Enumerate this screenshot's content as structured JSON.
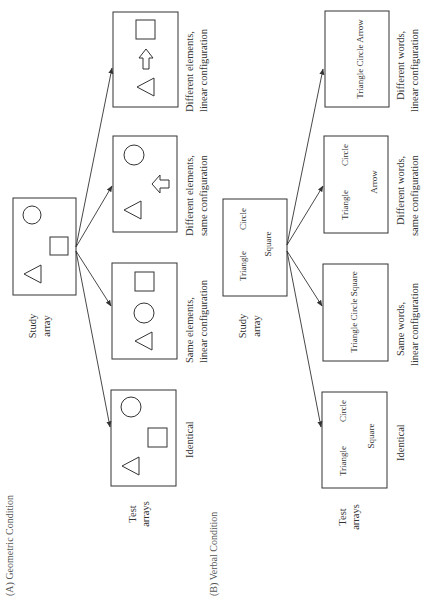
{
  "figure": {
    "orientation": "rotated-90-ccw",
    "titles": {
      "geometric": "(A) Geometric Condition",
      "verbal": "(B) Verbal Condition"
    },
    "labels": {
      "study_array_1": "Study",
      "study_array_2": "array",
      "test_arrays_1": "Test",
      "test_arrays_2": "arrays"
    },
    "geometric": {
      "study_shapes": [
        "circle",
        "square",
        "triangle"
      ],
      "tests": [
        {
          "caption_1": "Identical",
          "caption_2": "",
          "shapes": [
            "triangle",
            "square",
            "circle"
          ]
        },
        {
          "caption_1": "Same elements,",
          "caption_2": "linear configuration",
          "shapes": [
            "triangle",
            "circle",
            "square"
          ]
        },
        {
          "caption_1": "Different elements,",
          "caption_2": "same configuration",
          "shapes": [
            "triangle",
            "arrow",
            "circle"
          ]
        },
        {
          "caption_1": "Different elements,",
          "caption_2": "linear configuration",
          "shapes": [
            "triangle",
            "arrow",
            "square"
          ]
        }
      ]
    },
    "verbal": {
      "study_words": {
        "w1": "Triangle",
        "w2": "Circle",
        "w3": "Square"
      },
      "tests": [
        {
          "caption_1": "Identical",
          "caption_2": "",
          "w1": "Triangle",
          "w2": "Circle",
          "w3": "Square"
        },
        {
          "caption_1": "Same words,",
          "caption_2": "linear configuration",
          "line": "Triangle Circle Square"
        },
        {
          "caption_1": "Different words,",
          "caption_2": "same configuration",
          "w1": "Triangle",
          "w2": "Circle",
          "w3": "Arrow"
        },
        {
          "caption_1": "Different words,",
          "caption_2": "linear configuration",
          "line": "Triangle Circle Arrow"
        }
      ]
    },
    "colors": {
      "stroke": "#333333",
      "background": "#ffffff"
    }
  }
}
